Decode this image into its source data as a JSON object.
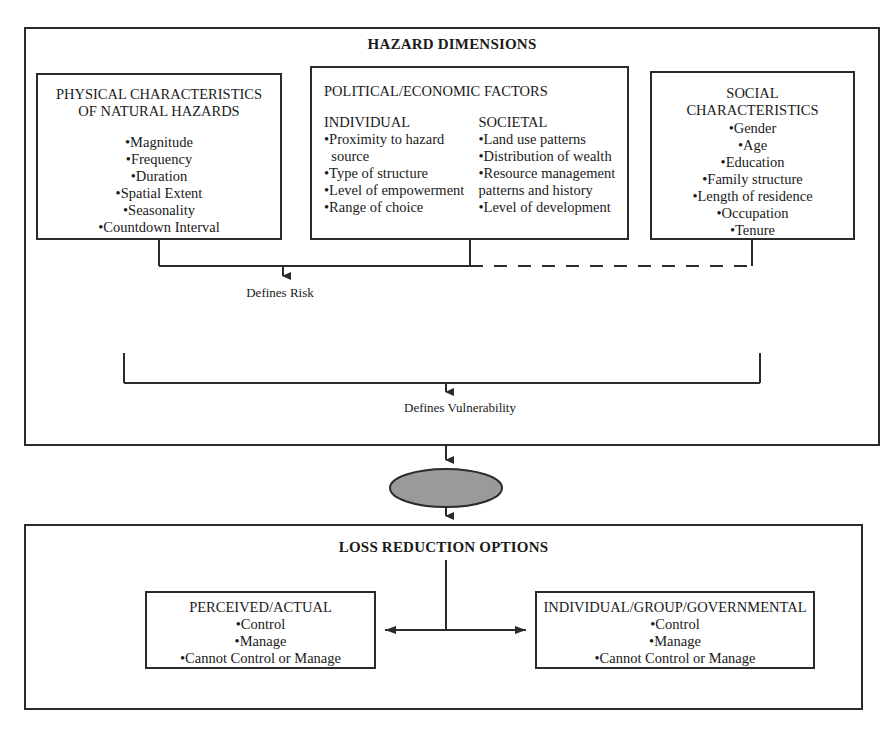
{
  "diagram": {
    "colors": {
      "line": "#2b2b2b",
      "context_fill": "#9a9a9a",
      "background": "#ffffff"
    },
    "upper_frame": {
      "heading": "HAZARD DIMENSIONS",
      "boxes": [
        {
          "name": "physical-characteristics",
          "title_lines": [
            "PHYSICAL CHARACTERISTICS",
            "OF NATURAL HAZARDS"
          ],
          "items": [
            "•Magnitude",
            "•Frequency",
            "•Duration",
            "•Spatial Extent",
            "•Seasonality",
            "•Countdown Interval"
          ]
        },
        {
          "name": "political-economic-factors",
          "title_lines": [
            "POLITICAL/ECONOMIC FACTORS"
          ],
          "columns": [
            {
              "subhead": "INDIVIDUAL",
              "items": [
                "•Proximity to hazard\n  source",
                "•Type of structure",
                "•Level of empowerment",
                "•Range of choice"
              ]
            },
            {
              "subhead": "SOCIETAL",
              "items": [
                "•Land use patterns",
                "•Distribution of wealth",
                "•Resource management\npatterns and history",
                "•Level of development"
              ]
            }
          ]
        },
        {
          "name": "social-characteristics",
          "title_lines": [
            "SOCIAL",
            "CHARACTERISTICS"
          ],
          "items": [
            "•Gender",
            "•Age",
            "•Education",
            "•Family structure",
            "•Length of residence",
            "•Occupation",
            "•Tenure"
          ]
        }
      ],
      "connector_labels": {
        "risk": "Defines Risk",
        "vulnerability": "Defines Vulnerability"
      }
    },
    "context_node": {
      "label": "CONTEXT"
    },
    "lower_frame": {
      "heading": "LOSS REDUCTION OPTIONS",
      "boxes": [
        {
          "name": "perceived-actual",
          "title": "PERCEIVED/ACTUAL",
          "items": [
            "•Control",
            "•Manage",
            "•Cannot Control or Manage"
          ]
        },
        {
          "name": "individual-group-governmental",
          "title": "INDIVIDUAL/GROUP/GOVERNMENTAL",
          "items": [
            "•Control",
            "•Manage",
            "•Cannot Control or Manage"
          ]
        }
      ]
    }
  }
}
